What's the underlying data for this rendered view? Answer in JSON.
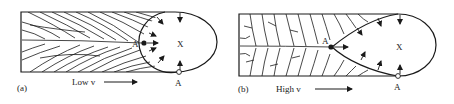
{
  "panels": [
    {
      "id": "a",
      "panel_label": "(a)",
      "speed_label": "Low v",
      "point_A_tip": "A",
      "point_A_edge": "A",
      "region_label": "X",
      "pool_shape": "elliptical"
    },
    {
      "id": "b",
      "panel_label": "(b)",
      "speed_label": "High v",
      "point_A_tip": "A",
      "point_A_edge": "A",
      "region_label": "X",
      "pool_shape": "teardrop"
    }
  ],
  "colors": {
    "line": "#1a1a1a",
    "background": "#ffffff"
  }
}
